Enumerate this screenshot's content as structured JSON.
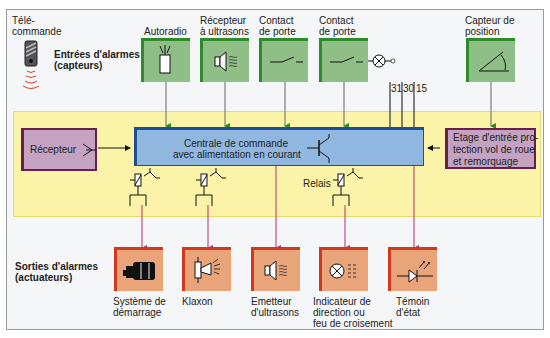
{
  "diagram": {
    "remote": {
      "label_line1": "Télé-",
      "label_line2": "commande"
    },
    "inputs_title": {
      "line1": "Entrées d'alarmes",
      "line2": "(capteurs)"
    },
    "outputs_title": {
      "line1": "Sorties d'alarmes",
      "line2": "(actuateurs)"
    },
    "sensors": [
      {
        "line1": "Autoradio",
        "line2": "",
        "icon": "radio-antenna-icon"
      },
      {
        "line1": "Récepteur",
        "line2": "à ultrasons",
        "icon": "ultrasonic-speaker-icon"
      },
      {
        "line1": "Contact",
        "line2": "de porte",
        "icon": "switch-icon"
      },
      {
        "line1": "Contact",
        "line2": "de porte",
        "icon": "switch-icon"
      },
      {
        "line1": "Capteur de",
        "line2": "position",
        "icon": "angle-sensor-icon"
      }
    ],
    "terminals": [
      "31",
      "30",
      "15"
    ],
    "receiver": {
      "label": "Récepteur"
    },
    "central_unit": {
      "line1": "Centrale de commande",
      "line2": "avec alimentation en courant"
    },
    "relays_label": "Relais",
    "input_stage": {
      "line1": "Etage d'entrée pro-",
      "line2": "tection vol de roue",
      "line3": "et remorquage"
    },
    "actuators": [
      {
        "line1": "Système de",
        "line2": "démarrage",
        "line3": "",
        "icon": "starter-motor-icon"
      },
      {
        "line1": "Klaxon",
        "line2": "",
        "line3": "",
        "icon": "horn-icon"
      },
      {
        "line1": "Emetteur",
        "line2": "d'ultrasons",
        "line3": "",
        "icon": "ultrasonic-emitter-icon"
      },
      {
        "line1": "Indicateur de",
        "line2": "direction ou",
        "line3": "feu de croisement",
        "icon": "lamp-indicator-icon"
      },
      {
        "line1": "Témoin",
        "line2": "d'état",
        "line3": "",
        "icon": "led-icon"
      }
    ],
    "colors": {
      "sensor_fill": "#8fbf87",
      "sensor_border": "#2f8a2a",
      "actuator_fill": "#e9a47a",
      "actuator_border": "#d0391e",
      "central_fill": "#8fb7df",
      "central_border": "#1b4f95",
      "purple_fill": "#c4a2c1",
      "purple_border": "#6b1e4c",
      "zone_fill": "#fbf4a8"
    }
  }
}
